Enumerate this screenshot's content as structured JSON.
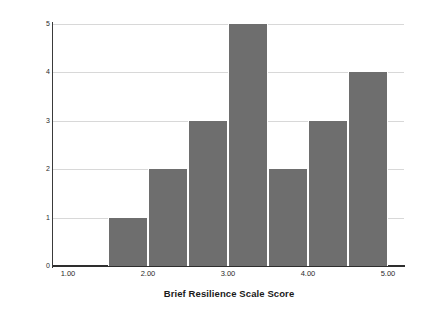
{
  "chart_data": {
    "type": "bar",
    "title": "",
    "subtitle": "",
    "xlabel": "Brief Resilience Scale Score",
    "ylabel": "Frequency",
    "xlim": [
      1.0,
      5.0
    ],
    "ylim": [
      0,
      5
    ],
    "grid": true,
    "legend": null,
    "bin_width": 0.5,
    "bar_color": "#6e6e6e",
    "gridline_color": "#d8d8d8",
    "axis_color": "#2e2e2e",
    "x_tick_labels": [
      "1.00",
      "2.00",
      "3.00",
      "4.00",
      "5.00"
    ],
    "x_tick_values": [
      1.0,
      2.0,
      3.0,
      4.0,
      5.0
    ],
    "y_tick_labels": [
      "0",
      "1",
      "2",
      "3",
      "4",
      "5"
    ],
    "y_tick_values": [
      0,
      1,
      2,
      3,
      4,
      5
    ],
    "categories": [
      "1.5-2.0",
      "2.0-2.5",
      "2.5-3.0",
      "3.0-3.5",
      "3.5-4.0",
      "4.0-4.5",
      "4.5-5.0"
    ],
    "bin_starts": [
      1.5,
      2.0,
      2.5,
      3.0,
      3.5,
      4.0,
      4.5
    ],
    "bin_ends": [
      2.0,
      2.5,
      3.0,
      3.5,
      4.0,
      4.5,
      5.0
    ],
    "values": [
      1,
      2,
      3,
      5,
      2,
      3,
      4
    ],
    "total_count": 20
  },
  "axes": {
    "x_title": "Brief Resilience Scale Score",
    "y_title": "Frequency"
  }
}
